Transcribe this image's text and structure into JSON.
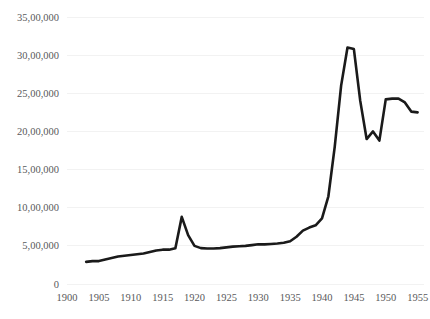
{
  "chart_data": {
    "type": "line",
    "title": "",
    "subtitle": "",
    "xlabel": "",
    "ylabel": "",
    "xlim": [
      1900,
      1956
    ],
    "ylim": [
      0,
      3500000
    ],
    "grid": true,
    "legend": false,
    "legend_position": "none",
    "y_tick_labels": [
      "0",
      "5,00,000",
      "10,00,000",
      "15,00,000",
      "20,00,000",
      "25,00,000",
      "30,00,000",
      "35,00,000"
    ],
    "y_tick_values": [
      0,
      500000,
      1000000,
      1500000,
      2000000,
      2500000,
      3000000,
      3500000
    ],
    "x_tick_labels": [
      "1900",
      "1905",
      "1910",
      "1915",
      "1920",
      "1925",
      "1930",
      "1935",
      "1940",
      "1945",
      "1950",
      "1955"
    ],
    "x_tick_values": [
      1900,
      1905,
      1910,
      1915,
      1920,
      1925,
      1930,
      1935,
      1940,
      1945,
      1950,
      1955
    ],
    "series": [
      {
        "name": "series-1",
        "color": "#1a1a1a",
        "x": [
          1903,
          1904,
          1905,
          1906,
          1907,
          1908,
          1909,
          1910,
          1911,
          1912,
          1913,
          1914,
          1915,
          1916,
          1917,
          1918,
          1919,
          1920,
          1921,
          1922,
          1923,
          1924,
          1925,
          1926,
          1927,
          1928,
          1929,
          1930,
          1931,
          1932,
          1933,
          1934,
          1935,
          1936,
          1937,
          1938,
          1939,
          1940,
          1941,
          1942,
          1943,
          1944,
          1945,
          1946,
          1947,
          1948,
          1949,
          1950,
          1951,
          1952,
          1953,
          1954,
          1955
        ],
        "values": [
          290000,
          300000,
          300000,
          320000,
          340000,
          360000,
          370000,
          380000,
          390000,
          400000,
          420000,
          440000,
          450000,
          450000,
          470000,
          880000,
          640000,
          500000,
          470000,
          465000,
          465000,
          470000,
          480000,
          490000,
          495000,
          500000,
          510000,
          520000,
          520000,
          525000,
          530000,
          540000,
          560000,
          620000,
          700000,
          740000,
          770000,
          860000,
          1150000,
          1800000,
          2600000,
          3100000,
          3080000,
          2400000,
          1900000,
          2000000,
          1880000,
          2420000,
          2430000,
          2430000,
          2380000,
          2260000,
          2250000
        ]
      }
    ]
  }
}
